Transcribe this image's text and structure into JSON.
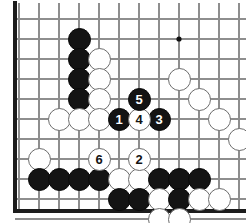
{
  "diagram": {
    "type": "go-board",
    "board": {
      "origin_x": 19,
      "origin_y": 19,
      "spacing": 20,
      "cols": 12,
      "rows": 10,
      "line_color": "#8e8e8e",
      "edge_color": "#1c1c1c",
      "background": "#ffffff",
      "left_edge": true,
      "bottom_edge": true,
      "star_points": [
        {
          "col": 8,
          "row": 1
        }
      ]
    },
    "stone_colors": {
      "black": "#131313",
      "white": "#ffffff",
      "white_border": "#6d6d6d",
      "black_label": "#ffffff",
      "white_label": "#131313"
    },
    "move_sequence": [
      {
        "number": "1",
        "color": "black",
        "col": 5,
        "row": 5
      },
      {
        "number": "2",
        "color": "white",
        "col": 6,
        "row": 7
      },
      {
        "number": "3",
        "color": "black",
        "col": 7,
        "row": 5
      },
      {
        "number": "4",
        "color": "white",
        "col": 6,
        "row": 5
      },
      {
        "number": "5",
        "color": "black",
        "col": 6,
        "row": 4
      },
      {
        "number": "6",
        "color": "white",
        "col": 4,
        "row": 7
      }
    ],
    "stones": [
      {
        "color": "black",
        "col": 3,
        "row": 1
      },
      {
        "color": "black",
        "col": 3,
        "row": 2
      },
      {
        "color": "black",
        "col": 3,
        "row": 3
      },
      {
        "color": "black",
        "col": 3,
        "row": 4
      },
      {
        "color": "white",
        "col": 4,
        "row": 2
      },
      {
        "color": "white",
        "col": 4,
        "row": 3
      },
      {
        "color": "white",
        "col": 4,
        "row": 4
      },
      {
        "color": "white",
        "col": 2,
        "row": 5
      },
      {
        "color": "white",
        "col": 3,
        "row": 5
      },
      {
        "color": "white",
        "col": 4,
        "row": 5
      },
      {
        "color": "white",
        "col": 1,
        "row": 7
      },
      {
        "color": "white",
        "col": 8,
        "row": 3
      },
      {
        "color": "white",
        "col": 9,
        "row": 4
      },
      {
        "color": "white",
        "col": 10,
        "row": 5
      },
      {
        "color": "white",
        "col": 11,
        "row": 6
      },
      {
        "color": "black",
        "col": 1,
        "row": 8
      },
      {
        "color": "black",
        "col": 2,
        "row": 8
      },
      {
        "color": "black",
        "col": 3,
        "row": 8
      },
      {
        "color": "black",
        "col": 4,
        "row": 8
      },
      {
        "color": "white",
        "col": 5,
        "row": 8
      },
      {
        "color": "white",
        "col": 6,
        "row": 8
      },
      {
        "color": "black",
        "col": 7,
        "row": 8
      },
      {
        "color": "black",
        "col": 8,
        "row": 8
      },
      {
        "color": "black",
        "col": 9,
        "row": 8
      },
      {
        "color": "black",
        "col": 5,
        "row": 9
      },
      {
        "color": "black",
        "col": 6,
        "row": 9
      },
      {
        "color": "white",
        "col": 7,
        "row": 9
      },
      {
        "color": "black",
        "col": 8,
        "row": 9
      },
      {
        "color": "white",
        "col": 9,
        "row": 9
      },
      {
        "color": "white",
        "col": 10,
        "row": 9
      },
      {
        "color": "white",
        "col": 7,
        "row": 10
      },
      {
        "color": "white",
        "col": 8,
        "row": 10
      }
    ]
  }
}
